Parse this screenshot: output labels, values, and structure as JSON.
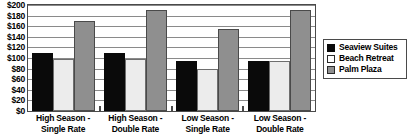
{
  "chart_data": {
    "type": "bar",
    "title": "",
    "subtitle": "",
    "xlabel": "",
    "ylabel": "",
    "ylim": [
      0,
      200
    ],
    "ytick_step": 20,
    "ytick_labels": [
      "$200",
      "$180",
      "$160",
      "$140",
      "$120",
      "$100",
      "$80",
      "$60",
      "$40",
      "$20",
      "$0"
    ],
    "ytick_values": [
      200,
      180,
      160,
      140,
      120,
      100,
      80,
      60,
      40,
      20,
      0
    ],
    "grid": true,
    "legend_position": "right",
    "categories": [
      "High Season -\nSingle Rate",
      "High Season -\nDouble Rate",
      "Low Season -\nSingle Rate",
      "Low Season -\nDouble Rate"
    ],
    "category_lines": [
      [
        "High Season -",
        "Single Rate"
      ],
      [
        "High Season -",
        "Double Rate"
      ],
      [
        "Low Season -",
        "Single Rate"
      ],
      [
        "Low Season -",
        "Double Rate"
      ]
    ],
    "series": [
      {
        "name": "Seaview Suites",
        "color": "#0a0a0a",
        "values": [
          110,
          110,
          95,
          95
        ]
      },
      {
        "name": "Beach Retreat",
        "color": "#ececec",
        "values": [
          99,
          99,
          80,
          95
        ]
      },
      {
        "name": "Palm Plaza",
        "color": "#8f8f8f",
        "values": [
          170,
          190,
          155,
          190
        ]
      }
    ]
  },
  "legend": {
    "entries": [
      {
        "label": "Seaview Suites"
      },
      {
        "label": "Beach Retreat"
      },
      {
        "label": "Palm Plaza"
      }
    ]
  }
}
